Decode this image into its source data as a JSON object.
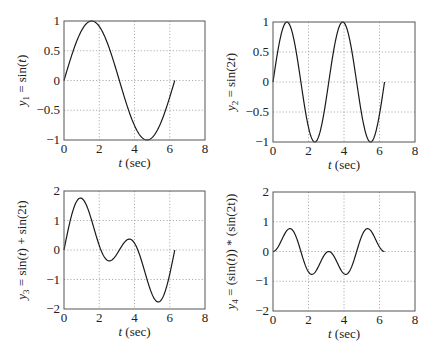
{
  "chart_data": [
    {
      "type": "line",
      "title": "",
      "xlabel": "t (sec)",
      "ylabel": "y1 = sin(t)",
      "ylabel_parts": {
        "var": "y",
        "sub": "1",
        "expr": " = sin(",
        "arg": "t",
        "close": ")"
      },
      "xlim": [
        0,
        8
      ],
      "ylim": [
        -1,
        1
      ],
      "xticks": [
        0,
        2,
        4,
        6,
        8
      ],
      "xtick_labels": [
        "0",
        "2",
        "4",
        "6",
        "8"
      ],
      "yticks": [
        -1,
        -0.5,
        0,
        0.5,
        1
      ],
      "ytick_labels": [
        "−1",
        "−0.5",
        "0",
        "0.5",
        "1"
      ],
      "grid": true,
      "x_range": [
        0,
        6.2832
      ],
      "function": "sin(t)",
      "series": [
        {
          "name": "y1",
          "x": [
            0,
            0.785,
            1.571,
            2.356,
            3.142,
            3.927,
            4.712,
            5.498,
            6.283
          ],
          "y": [
            0,
            0.707,
            1,
            0.707,
            0,
            -0.707,
            -1,
            -0.707,
            0
          ]
        }
      ]
    },
    {
      "type": "line",
      "title": "",
      "xlabel": "t (sec)",
      "ylabel": "y2 = sin(2t)",
      "ylabel_parts": {
        "var": "y",
        "sub": "2",
        "expr": " = sin(2",
        "arg": "t",
        "close": ")"
      },
      "xlim": [
        0,
        8
      ],
      "ylim": [
        -1,
        1
      ],
      "xticks": [
        0,
        2,
        4,
        6,
        8
      ],
      "xtick_labels": [
        "0",
        "2",
        "4",
        "6",
        "8"
      ],
      "yticks": [
        -1,
        -0.5,
        0,
        0.5,
        1
      ],
      "ytick_labels": [
        "−1",
        "−0.5",
        "0",
        "0.5",
        "1"
      ],
      "grid": true,
      "x_range": [
        0,
        6.2832
      ],
      "function": "sin(2t)",
      "series": [
        {
          "name": "y2",
          "x": [
            0,
            0.785,
            1.571,
            2.356,
            3.142,
            3.927,
            4.712,
            5.498,
            6.283
          ],
          "y": [
            0,
            1,
            0,
            -1,
            0,
            1,
            0,
            -1,
            0
          ]
        }
      ]
    },
    {
      "type": "line",
      "title": "",
      "xlabel": "t (sec)",
      "ylabel": "y3 = sin(t) + sin(2t)",
      "ylabel_parts": {
        "var": "y",
        "sub": "3",
        "expr": " = sin(",
        "arg": "t",
        "close": ") + sin(2t)"
      },
      "xlim": [
        0,
        8
      ],
      "ylim": [
        -2,
        2
      ],
      "xticks": [
        0,
        2,
        4,
        6,
        8
      ],
      "xtick_labels": [
        "0",
        "2",
        "4",
        "6",
        "8"
      ],
      "yticks": [
        -2,
        -1,
        0,
        1,
        2
      ],
      "ytick_labels": [
        "−2",
        "−1",
        "0",
        "1",
        "2"
      ],
      "grid": true,
      "x_range": [
        0,
        6.2832
      ],
      "function": "sin(t)+sin(2t)",
      "series": [
        {
          "name": "y3",
          "x": [
            0,
            0.94,
            2.64,
            3.64,
            5.35,
            6.283
          ],
          "y": [
            0,
            1.76,
            -0.37,
            0.37,
            -1.76,
            0
          ]
        }
      ]
    },
    {
      "type": "line",
      "title": "",
      "xlabel": "t (sec)",
      "ylabel": "y4 = (sin(t)) * (sin(2t))",
      "ylabel_parts": {
        "var": "y",
        "sub": "4",
        "expr": " = (sin(",
        "arg": "t",
        "close": ")) * (sin(2t))"
      },
      "xlim": [
        0,
        8
      ],
      "ylim": [
        -2,
        2
      ],
      "xticks": [
        0,
        2,
        4,
        6,
        8
      ],
      "xtick_labels": [
        "0",
        "2",
        "4",
        "6",
        "8"
      ],
      "yticks": [
        -2,
        -1,
        0,
        1,
        2
      ],
      "ytick_labels": [
        "−2",
        "−1",
        "0",
        "1",
        "2"
      ],
      "grid": true,
      "x_range": [
        0,
        6.2832
      ],
      "function": "sin(t)*sin(2t)",
      "series": [
        {
          "name": "y4",
          "x": [
            0,
            0.955,
            2.186,
            3.142,
            4.097,
            5.328,
            6.283
          ],
          "y": [
            0,
            1.54,
            -1.54,
            0,
            -1.54,
            1.54,
            0
          ]
        }
      ]
    }
  ]
}
